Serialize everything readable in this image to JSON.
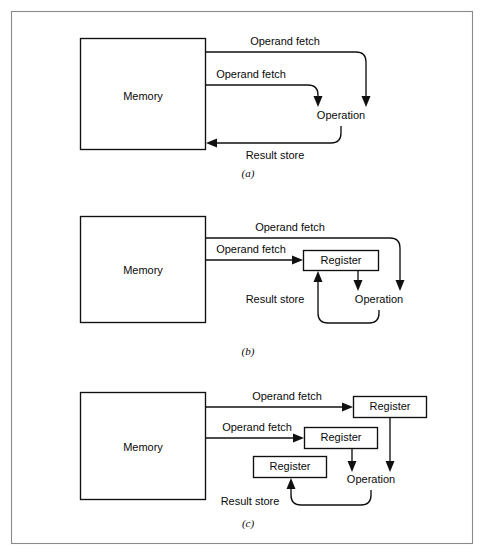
{
  "figure": {
    "frame": {
      "color": "#8a8a8a"
    },
    "line_color": "#101010",
    "background": "#ffffff"
  },
  "panels": [
    {
      "id": "a",
      "label": "(a)",
      "memory_label": "Memory",
      "operation_label": "Operation",
      "arrows": [
        {
          "name": "operand-fetch-top",
          "label": "Operand fetch"
        },
        {
          "name": "operand-fetch-second",
          "label": "Operand fetch"
        },
        {
          "name": "result-store",
          "label": "Result store"
        }
      ],
      "registers": []
    },
    {
      "id": "b",
      "label": "(b)",
      "memory_label": "Memory",
      "operation_label": "Operation",
      "arrows": [
        {
          "name": "operand-fetch-top",
          "label": "Operand fetch"
        },
        {
          "name": "operand-fetch-second",
          "label": "Operand fetch"
        },
        {
          "name": "result-store",
          "label": "Result store"
        }
      ],
      "registers": [
        {
          "name": "register-1",
          "label": "Register"
        }
      ]
    },
    {
      "id": "c",
      "label": "(c)",
      "memory_label": "Memory",
      "operation_label": "Operation",
      "arrows": [
        {
          "name": "operand-fetch-top",
          "label": "Operand fetch"
        },
        {
          "name": "operand-fetch-second",
          "label": "Operand fetch"
        },
        {
          "name": "result-store",
          "label": "Result store"
        }
      ],
      "registers": [
        {
          "name": "register-top",
          "label": "Register"
        },
        {
          "name": "register-middle",
          "label": "Register"
        },
        {
          "name": "register-result",
          "label": "Register"
        }
      ]
    }
  ]
}
